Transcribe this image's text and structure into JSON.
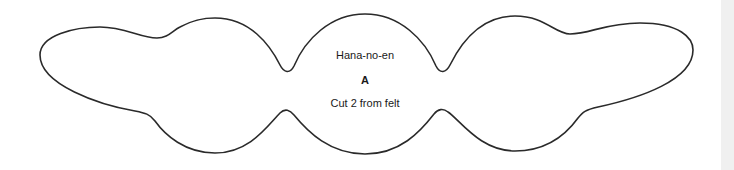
{
  "pattern": {
    "title": "Hana-no-en",
    "piece_letter": "A",
    "instruction": "Cut 2 from felt",
    "outline_color": "#2a2a2a"
  },
  "side_bar": {
    "color": "#f0f0f0"
  }
}
